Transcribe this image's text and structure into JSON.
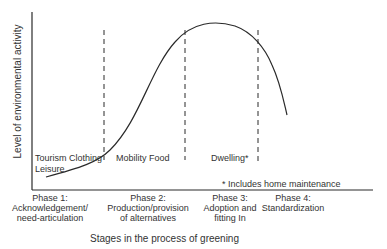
{
  "axes": {
    "y_label": "Level of environmental activity",
    "x_label": "Stages in the process of greening"
  },
  "phases": [
    {
      "title": "Phase 1:",
      "line1": "Acknowledgement/",
      "line2": "need-articulation"
    },
    {
      "title": "Phase 2:",
      "line1": "Production/provision",
      "line2": "of alternatives"
    },
    {
      "title": "Phase 3:",
      "line1": "Adoption and",
      "line2": "fitting In"
    },
    {
      "title": "Phase 4:",
      "line1": "Standardization",
      "line2": ""
    }
  ],
  "domains": {
    "phase1_line1": "Tourism Clothing",
    "phase1_line2": "Leisure",
    "phase2": "Mobility Food",
    "phase3": "Dwelling*"
  },
  "footnote": "* Includes home maintenance",
  "colors": {
    "line": "#2a2a2a",
    "text": "#333333",
    "background": "#ffffff"
  }
}
